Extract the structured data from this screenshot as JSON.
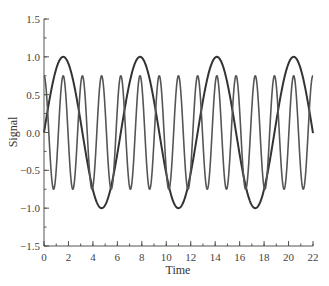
{
  "chart_data": {
    "type": "line",
    "title": "",
    "xlabel": "Time",
    "ylabel": "Signal",
    "xlim": [
      0,
      22
    ],
    "ylim": [
      -1.5,
      1.5
    ],
    "x_ticks": [
      0,
      2,
      4,
      6,
      8,
      10,
      12,
      14,
      16,
      18,
      20,
      22
    ],
    "x_tick_labels": [
      "0",
      "2",
      "4",
      "6",
      "8",
      "10",
      "12",
      "14",
      "16",
      "18",
      "20",
      "22"
    ],
    "x_minor_step": 1,
    "y_ticks": [
      -1.5,
      -1.0,
      -0.5,
      0.0,
      0.5,
      1.0,
      1.5
    ],
    "y_tick_labels": [
      "−1.5",
      "−1.0",
      "−0.5",
      "0.0",
      "0.5",
      "1.0",
      "1.5"
    ],
    "y_minor_step": 0.25,
    "grid": false,
    "legend": null,
    "series": [
      {
        "name": "sin(t)",
        "description": "Amplitude 1.0, period ≈ 6.28",
        "amplitude": 1.0,
        "angular_frequency": 1,
        "phase": "sine",
        "color": "#333333",
        "stroke_width": 2,
        "x": [
          0,
          1.571,
          3.142,
          4.712,
          6.283,
          7.854,
          9.425,
          10.996,
          12.566,
          14.137,
          15.708,
          17.279,
          18.85,
          20.42,
          22
        ],
        "values": [
          0,
          1.0,
          0,
          -1.0,
          0,
          1.0,
          0,
          -1.0,
          0,
          1.0,
          0,
          -1.0,
          0,
          1.0,
          -0.01
        ]
      },
      {
        "name": "0.75·cos(4t)",
        "description": "Amplitude 0.75, period ≈ 1.57",
        "amplitude": 0.75,
        "angular_frequency": 4,
        "phase": "cosine",
        "color": "#555555",
        "stroke_width": 1.6,
        "x": [
          0,
          0.785,
          1.571,
          2.356,
          3.142,
          3.927,
          4.712,
          5.498,
          6.283,
          7.069,
          7.854,
          8.639,
          9.425,
          10.21,
          10.996,
          11.781,
          12.566,
          13.352,
          14.137,
          14.923,
          15.708,
          16.493,
          17.279,
          18.064,
          18.85,
          19.635,
          20.42,
          21.206,
          22
        ],
        "values": [
          0.75,
          -0.75,
          0.75,
          -0.75,
          0.75,
          -0.75,
          0.75,
          -0.75,
          0.75,
          -0.75,
          0.75,
          -0.75,
          0.75,
          -0.75,
          0.75,
          -0.75,
          0.75,
          -0.75,
          0.75,
          -0.75,
          0.75,
          -0.75,
          0.75,
          -0.75,
          0.75,
          -0.75,
          0.75,
          -0.75,
          0.75
        ]
      }
    ]
  }
}
